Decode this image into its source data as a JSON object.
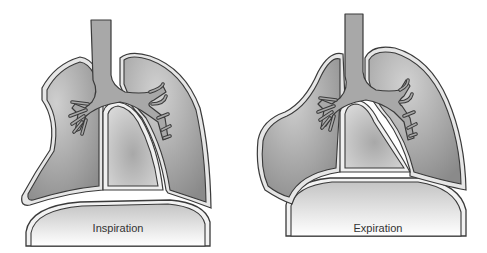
{
  "figure": {
    "panels": [
      {
        "id": "inspiration",
        "label": "Inspiration"
      },
      {
        "id": "expiration",
        "label": "Expiration"
      }
    ]
  },
  "colors": {
    "background": "#ffffff",
    "outline": "#3a3a3a",
    "pleura": "#e4e4e4",
    "lung_fill": "#9a9a9a",
    "lung_light": "#c4c4c4",
    "airway": "#a8a8a8",
    "heart": "#c6c6c6",
    "diaphragm_top": "#cfcfcf",
    "diaphragm_bottom": "#ffffff"
  }
}
